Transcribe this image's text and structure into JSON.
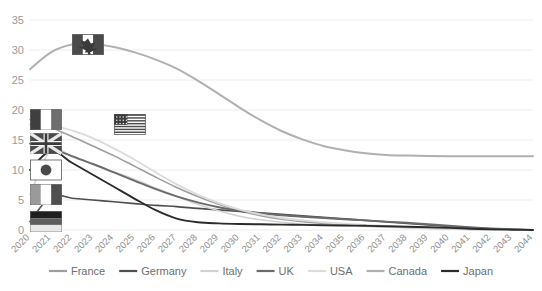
{
  "chart_data": {
    "type": "line",
    "title": "",
    "subtitle": "",
    "xlabel": "",
    "ylabel": "",
    "grid": true,
    "legend_position": "bottom",
    "ylim": [
      0,
      35
    ],
    "yticks": [
      0,
      5,
      10,
      15,
      20,
      25,
      30,
      35
    ],
    "x": [
      "2020",
      "2021",
      "2022",
      "2023",
      "2024",
      "2025",
      "2026",
      "2027",
      "2028",
      "2029",
      "2030",
      "2031",
      "2032",
      "2033",
      "2034",
      "2035",
      "2036",
      "2037",
      "2038",
      "2039",
      "2040",
      "2041",
      "2042",
      "2043",
      "2044"
    ],
    "categories": [
      "2020",
      "2021",
      "2022",
      "2023",
      "2024",
      "2025",
      "2026",
      "2027",
      "2028",
      "2029",
      "2030",
      "2031",
      "2032",
      "2033",
      "2034",
      "2035",
      "2036",
      "2037",
      "2038",
      "2039",
      "2040",
      "2041",
      "2042",
      "2043",
      "2044"
    ],
    "series": [
      {
        "name": "France",
        "color": "#9e9e9e",
        "width": 1.6,
        "values": [
          18.4,
          17.1,
          15.6,
          14.0,
          12.4,
          10.6,
          8.8,
          7.1,
          5.6,
          4.3,
          3.2,
          2.4,
          1.8,
          1.4,
          1.1,
          0.9,
          0.7,
          0.55,
          0.42,
          0.3,
          0.2,
          0.1,
          0.05,
          0.02,
          0.0
        ]
      },
      {
        "name": "Germany",
        "color": "#4f4f4f",
        "width": 1.6,
        "values": [
          1.4,
          5.6,
          5.3,
          5.0,
          4.7,
          4.4,
          4.1,
          3.9,
          3.6,
          3.35,
          3.1,
          2.85,
          2.6,
          2.35,
          2.1,
          1.85,
          1.6,
          1.35,
          1.1,
          0.85,
          0.6,
          0.35,
          0.2,
          0.1,
          0.0
        ]
      },
      {
        "name": "Italy",
        "color": "#d2d2d2",
        "width": 1.6,
        "values": [
          5.9,
          13.4,
          12.2,
          11.0,
          9.7,
          8.4,
          7.0,
          5.6,
          4.3,
          3.2,
          2.3,
          1.7,
          1.3,
          1.0,
          0.85,
          0.7,
          0.58,
          0.47,
          0.37,
          0.27,
          0.17,
          0.08,
          0.03,
          0.01,
          0.0
        ]
      },
      {
        "name": "UK",
        "color": "#6b6b6b",
        "width": 1.9,
        "values": [
          14.4,
          13.6,
          12.3,
          11.0,
          9.6,
          8.2,
          6.8,
          5.6,
          4.6,
          3.8,
          3.2,
          2.8,
          2.45,
          2.2,
          2.0,
          1.8,
          1.6,
          1.4,
          1.2,
          0.95,
          0.7,
          0.45,
          0.25,
          0.1,
          0.0
        ]
      },
      {
        "name": "USA",
        "color": "#dcdcdc",
        "width": 1.9,
        "values": [
          17.6,
          17.4,
          16.6,
          15.3,
          13.6,
          11.7,
          9.6,
          7.6,
          5.9,
          4.5,
          3.4,
          2.6,
          2.0,
          1.6,
          1.3,
          1.05,
          0.85,
          0.68,
          0.52,
          0.38,
          0.25,
          0.12,
          0.05,
          0.02,
          0.0
        ]
      },
      {
        "name": "Canada",
        "color": "#b0b0b0",
        "width": 2.0,
        "values": [
          26.8,
          29.6,
          30.9,
          31.0,
          30.5,
          29.6,
          28.4,
          26.9,
          24.9,
          22.7,
          20.4,
          18.3,
          16.5,
          15.1,
          14.0,
          13.3,
          12.8,
          12.5,
          12.4,
          12.35,
          12.3,
          12.3,
          12.3,
          12.3,
          12.3
        ]
      },
      {
        "name": "Japan",
        "color": "#2b2b2b",
        "width": 1.9,
        "values": [
          10.0,
          13.2,
          11.2,
          9.2,
          7.2,
          5.2,
          3.3,
          1.9,
          1.3,
          1.1,
          1.0,
          0.95,
          0.9,
          0.85,
          0.8,
          0.75,
          0.7,
          0.62,
          0.54,
          0.45,
          0.35,
          0.22,
          0.12,
          0.05,
          0.0
        ]
      }
    ],
    "flag_markers": [
      {
        "country": "Canada",
        "x_index": 2,
        "value": 30.9,
        "label": "canada-flag"
      },
      {
        "country": "France",
        "x_index": 0,
        "value": 18.4,
        "label": "france-flag"
      },
      {
        "country": "USA",
        "x_index": 4,
        "value": 17.6,
        "label": "usa-flag"
      },
      {
        "country": "UK",
        "x_index": 0,
        "value": 14.4,
        "label": "uk-flag"
      },
      {
        "country": "Japan",
        "x_index": 0,
        "value": 10.0,
        "label": "japan-flag"
      },
      {
        "country": "Italy",
        "x_index": 0,
        "value": 5.9,
        "label": "italy-flag"
      },
      {
        "country": "Germany",
        "x_index": 0,
        "value": 1.4,
        "label": "germany-flag"
      }
    ],
    "legend": [
      {
        "name": "France",
        "color": "#9e9e9e"
      },
      {
        "name": "Germany",
        "color": "#4f4f4f"
      },
      {
        "name": "Italy",
        "color": "#d2d2d2"
      },
      {
        "name": "UK",
        "color": "#6b6b6b"
      },
      {
        "name": "USA",
        "color": "#dcdcdc"
      },
      {
        "name": "Canada",
        "color": "#b0b0b0"
      },
      {
        "name": "Japan",
        "color": "#2b2b2b"
      }
    ]
  },
  "axis": {
    "y_labels": [
      "35",
      "30",
      "25",
      "20",
      "15",
      "10",
      "5",
      "0"
    ],
    "x_labels": [
      "2020",
      "2021",
      "2022",
      "2023",
      "2024",
      "2025",
      "2026",
      "2027",
      "2028",
      "2029",
      "2030",
      "2031",
      "2032",
      "2033",
      "2034",
      "2035",
      "2036",
      "2037",
      "2038",
      "2039",
      "2040",
      "2041",
      "2042",
      "2043",
      "2044"
    ]
  },
  "colors": {
    "grid": "#ededed",
    "tick_text": "#9a9a9a",
    "legend_text": "#6e6e6e",
    "background": "#ffffff"
  }
}
